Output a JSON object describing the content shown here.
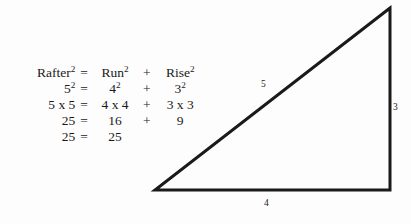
{
  "figure": {
    "name": "pythagorean-rafter-diagram",
    "background_color": "#fdfdfd",
    "ink_color": "#1a1a1a"
  },
  "equation": {
    "rows": [
      {
        "lhs": "Rafter",
        "lhs_sup": "2",
        "eq": "=",
        "mid": "Run",
        "mid_sup": "2",
        "op": "+",
        "rhs": "Rise",
        "rhs_sup": "2"
      },
      {
        "lhs": "5",
        "lhs_sup": "2",
        "eq": "=",
        "mid": "4",
        "mid_sup": "2",
        "op": "+",
        "rhs": "3",
        "rhs_sup": "2"
      },
      {
        "lhs": "5 x 5",
        "lhs_sup": "",
        "eq": "=",
        "mid": "4 x 4",
        "mid_sup": "",
        "op": "+",
        "rhs": "3 x 3",
        "rhs_sup": ""
      },
      {
        "lhs": "25",
        "lhs_sup": "",
        "eq": "=",
        "mid": "16",
        "mid_sup": "",
        "op": "+",
        "rhs": "9",
        "rhs_sup": ""
      },
      {
        "lhs": "25",
        "lhs_sup": "",
        "eq": "=",
        "mid": "25",
        "mid_sup": "",
        "op": "",
        "rhs": "",
        "rhs_sup": ""
      }
    ]
  },
  "triangle": {
    "vertices": {
      "apex": [
        390,
        8
      ],
      "bottom_left": [
        155,
        190
      ],
      "bottom_right": [
        390,
        190
      ]
    },
    "stroke_width": 3,
    "labels": {
      "hypotenuse": "5",
      "rise": "3",
      "run": "4"
    }
  }
}
